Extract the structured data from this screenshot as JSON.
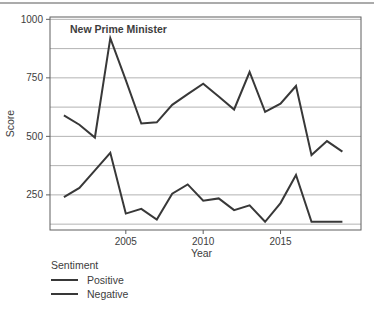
{
  "page": {
    "background": "#ffffff",
    "divider_color": "#ababab"
  },
  "chart_data": {
    "type": "line",
    "title_annotation": "New Prime Minister",
    "xlabel": "Year",
    "ylabel": "Score",
    "x": [
      2001,
      2002,
      2003,
      2004,
      2005,
      2006,
      2007,
      2008,
      2009,
      2010,
      2011,
      2012,
      2013,
      2014,
      2015,
      2016,
      2017,
      2018,
      2019
    ],
    "series": [
      {
        "name": "Positive",
        "color": "#383838",
        "values": [
          590,
          550,
          495,
          920,
          740,
          555,
          560,
          635,
          680,
          725,
          670,
          615,
          775,
          605,
          640,
          715,
          420,
          480,
          435
        ]
      },
      {
        "name": "Negative",
        "color": "#383838",
        "values": [
          240,
          280,
          355,
          430,
          170,
          190,
          145,
          255,
          295,
          225,
          235,
          185,
          205,
          135,
          215,
          335,
          135,
          135,
          135
        ]
      }
    ],
    "xlim": [
      2000.1,
      2020.2
    ],
    "ylim": [
      100,
      1010
    ],
    "x_ticks": [
      2005,
      2010,
      2015
    ],
    "y_ticks": [
      250,
      500,
      750,
      1000
    ],
    "gridline_values": [
      125,
      250,
      375,
      500,
      625,
      750,
      875,
      1000
    ],
    "grid_on": true,
    "grid_color": "#b3b3b3",
    "frame_color": "#5f5f5f",
    "text_color": "#3d3d3d",
    "legend": {
      "title": "Sentiment",
      "position": "bottom-left",
      "entries": [
        "Positive",
        "Negative"
      ]
    }
  }
}
